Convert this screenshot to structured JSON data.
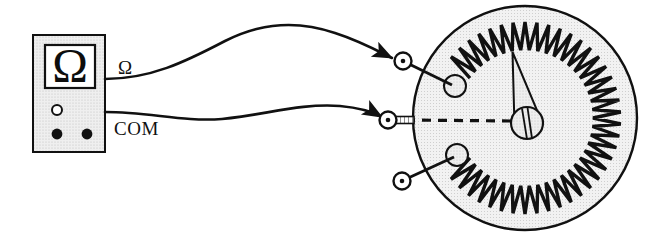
{
  "figure": {
    "type": "schematic-diagram",
    "background_color": "#ffffff",
    "ink_color": "#111111",
    "fill_gray": "#e9e9e9"
  },
  "meter": {
    "name": "ohmmeter",
    "display_symbol": "Ω",
    "body_color": "#e8e8e8",
    "display_color": "#ffffff",
    "knob_label": "",
    "jacks": [
      {
        "name": "selector-hole",
        "filled": false
      },
      {
        "name": "jack-left",
        "filled": true
      },
      {
        "name": "jack-right",
        "filled": true
      }
    ]
  },
  "labels": {
    "omega_lead": "Ω",
    "com_lead": "COM"
  },
  "leads": [
    {
      "name": "omega-lead-wire",
      "from": "omega-terminal",
      "to": "potentiometer-terminal-1",
      "arrow": true
    },
    {
      "name": "com-lead-wire",
      "from": "com-terminal",
      "to": "potentiometer-terminal-2",
      "arrow": true
    }
  ],
  "potentiometer": {
    "name": "rotary-potentiometer",
    "body_color": "#ececec",
    "resistive_element": {
      "style": "sawtooth-ring",
      "teeth": 40,
      "gap_degrees": 72
    },
    "wiper": {
      "name": "wiper-pointer",
      "angle_deg": -105,
      "hub_slot_lines": 2
    },
    "terminals": [
      {
        "name": "terminal-1",
        "position": "upper-left",
        "connected": true
      },
      {
        "name": "terminal-2",
        "position": "middle-left",
        "connected": true,
        "dashed_link_to_wiper": true
      },
      {
        "name": "terminal-3",
        "position": "lower-left",
        "connected": false
      }
    ]
  }
}
